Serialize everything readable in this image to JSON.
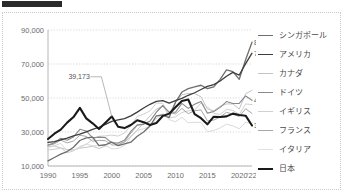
{
  "page": {
    "header_bar_label": "header-bar"
  },
  "chart_data": {
    "type": "line",
    "title": "",
    "subtitle": "",
    "xlabel": "",
    "ylabel": "",
    "xlim": [
      1990,
      2022
    ],
    "ylim": [
      10000,
      90000
    ],
    "grid": true,
    "legend_position": "right",
    "x_tick_labels": [
      "1990",
      "1995",
      "2000",
      "2005",
      "2010",
      "2015",
      "2020",
      "'22"
    ],
    "x_ticks": [
      1990,
      1995,
      2000,
      2005,
      2010,
      2015,
      2020,
      2022
    ],
    "y_tick_labels": [
      "10,000",
      "30,000",
      "50,000",
      "70,000",
      "90,000"
    ],
    "y_ticks": [
      10000,
      30000,
      50000,
      70000,
      90000
    ],
    "x": [
      1990,
      1991,
      1992,
      1993,
      1994,
      1995,
      1996,
      1997,
      1998,
      1999,
      2000,
      2001,
      2002,
      2003,
      2004,
      2005,
      2006,
      2007,
      2008,
      2009,
      2010,
      2011,
      2012,
      2013,
      2014,
      2015,
      2016,
      2017,
      2018,
      2019,
      2020,
      2021,
      2022
    ],
    "series": [
      {
        "name": "シンガポール",
        "color": "#6e6e6e",
        "width": 1.3,
        "end_value": 82808,
        "end_label": "82,808",
        "values": [
          13000,
          15000,
          17000,
          18500,
          21000,
          25000,
          26500,
          27000,
          22000,
          22500,
          24000,
          22000,
          23000,
          24000,
          27500,
          30000,
          33500,
          39500,
          40000,
          38500,
          47500,
          53500,
          55500,
          56500,
          57500,
          55500,
          56500,
          61000,
          66500,
          65500,
          61000,
          72500,
          82808
        ]
      },
      {
        "name": "アメリカ",
        "color": "#3d3d3d",
        "width": 1.3,
        "end_value": 76348,
        "end_label": "76,348",
        "values": [
          23900,
          24400,
          25400,
          26400,
          27700,
          28700,
          30100,
          31500,
          32800,
          34500,
          36300,
          37100,
          37900,
          39500,
          41700,
          44100,
          46300,
          48000,
          48400,
          47000,
          48500,
          49800,
          51600,
          53100,
          55000,
          56800,
          57900,
          60000,
          62800,
          65100,
          63500,
          70200,
          76348
        ]
      },
      {
        "name": "カナダ",
        "color": "#c4c4c4",
        "width": 1.0,
        "end_value": null,
        "end_label": "",
        "values": [
          21500,
          21800,
          20600,
          19700,
          19500,
          20500,
          21000,
          21600,
          20300,
          21800,
          24100,
          23300,
          23900,
          27500,
          31200,
          35400,
          39400,
          43500,
          45100,
          40600,
          47500,
          51900,
          52700,
          52600,
          50700,
          43600,
          42400,
          45100,
          46500,
          46500,
          43500,
          52500,
          54500
        ]
      },
      {
        "name": "ドイツ",
        "color": "#8a8a8a",
        "width": 1.1,
        "end_value": 48636,
        "end_label": "48,636",
        "values": [
          22300,
          23600,
          26300,
          25200,
          27100,
          31600,
          30600,
          26600,
          27000,
          26700,
          23700,
          23500,
          25200,
          30300,
          34200,
          34500,
          36300,
          41800,
          45600,
          41700,
          41600,
          46800,
          43900,
          46300,
          48000,
          41100,
          42100,
          44500,
          47900,
          46800,
          46800,
          51200,
          48636
        ]
      },
      {
        "name": "イギリス",
        "color": "#d0d0d0",
        "width": 1.0,
        "end_value": null,
        "end_label": "",
        "values": [
          19500,
          19800,
          20600,
          17800,
          18900,
          21500,
          22700,
          25700,
          27500,
          27700,
          28200,
          27600,
          29400,
          33800,
          39100,
          40500,
          42400,
          47000,
          46900,
          38300,
          38900,
          41500,
          42400,
          42800,
          47100,
          44800,
          41000,
          40300,
          43400,
          42700,
          40300,
          46500,
          46100
        ]
      },
      {
        "name": "フランス",
        "color": "#a8a8a8",
        "width": 1.0,
        "end_value": null,
        "end_label": "",
        "values": [
          22100,
          23000,
          25200,
          23600,
          24700,
          28100,
          27400,
          24600,
          25100,
          24900,
          22400,
          22300,
          24300,
          29400,
          33800,
          34900,
          36400,
          41500,
          45400,
          41500,
          40600,
          43800,
          40800,
          42500,
          43000,
          36600,
          37000,
          38800,
          41600,
          40500,
          39100,
          43700,
          40900
        ]
      },
      {
        "name": "イタリア",
        "color": "#dadada",
        "width": 1.0,
        "end_value": null,
        "end_label": "",
        "values": [
          20800,
          21900,
          23300,
          18900,
          19300,
          20600,
          23000,
          21800,
          22200,
          22100,
          20100,
          20300,
          22100,
          27000,
          30900,
          31900,
          33300,
          37800,
          41000,
          37300,
          36000,
          38700,
          35400,
          35700,
          35600,
          30200,
          30900,
          32400,
          34600,
          33600,
          31900,
          35800,
          34800
        ]
      },
      {
        "name": "日本",
        "color": "#1a1a1a",
        "width": 2.1,
        "end_value": 33822,
        "end_label": "33,822",
        "values": [
          25900,
          29000,
          31400,
          35500,
          38800,
          44200,
          38000,
          35100,
          31800,
          35500,
          39173,
          33100,
          32300,
          34100,
          36900,
          35800,
          34100,
          35300,
          39400,
          40800,
          44500,
          48200,
          49100,
          40500,
          38100,
          34500,
          39000,
          38800,
          39200,
          40800,
          40000,
          39600,
          33822
        ]
      }
    ],
    "annotations": [
      {
        "text": "39,173",
        "value": 39173,
        "x": 2000,
        "series": "日本"
      }
    ],
    "end_labels": [
      {
        "text": "82,808",
        "series": "シンガポール"
      },
      {
        "text": "76,348",
        "series": "アメリカ"
      },
      {
        "text": "48,636",
        "series": "ドイツ"
      },
      {
        "text": "33,822",
        "series": "日本"
      }
    ]
  },
  "legend": {
    "items": [
      {
        "label": "シンガポール",
        "color": "#6e6e6e",
        "width": "1.3px"
      },
      {
        "label": "アメリカ",
        "color": "#3d3d3d",
        "width": "1.4px"
      },
      {
        "label": "カナダ",
        "color": "#c4c4c4",
        "width": "1.1px"
      },
      {
        "label": "ドイツ",
        "color": "#8a8a8a",
        "width": "1.2px"
      },
      {
        "label": "イギリス",
        "color": "#d0d0d0",
        "width": "1.1px"
      },
      {
        "label": "フランス",
        "color": "#a8a8a8",
        "width": "1.1px"
      },
      {
        "label": "イタリア",
        "color": "#e2e2e2",
        "width": "1.0px"
      },
      {
        "label": "日本",
        "color": "#1a1a1a",
        "width": "2.2px"
      }
    ]
  }
}
